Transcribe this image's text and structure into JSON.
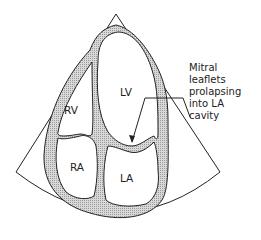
{
  "diagram": {
    "chambers": [
      {
        "id": "LV",
        "label": "LV"
      },
      {
        "id": "RV",
        "label": "RV"
      },
      {
        "id": "RA",
        "label": "RA"
      },
      {
        "id": "LA",
        "label": "LA"
      }
    ],
    "annotation": {
      "lines": [
        "Mitral",
        "leaflets",
        "prolapsing",
        "into LA",
        "cavity"
      ]
    },
    "colors": {
      "outline": "#222222",
      "wall_fill": "#c8c8c8",
      "background": "#ffffff"
    }
  }
}
